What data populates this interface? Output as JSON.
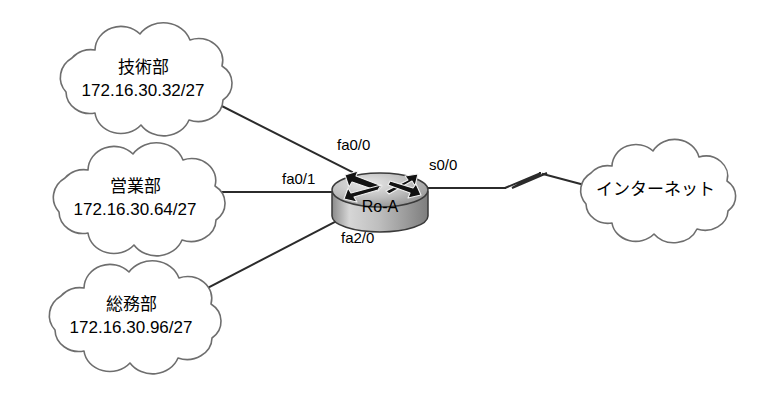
{
  "diagram": {
    "background_color": "#ffffff",
    "line_color": "#2b2b2b",
    "cloud_stroke_color": "#6e6e6e",
    "router_fill_color": "#a9a9a9"
  },
  "clouds": [
    {
      "id": "cloud-gijutsubu",
      "name": "技術部",
      "subnet": "172.16.30.32/27",
      "cx": 143,
      "cy": 78,
      "rx": 88,
      "ry": 53
    },
    {
      "id": "cloud-eigyoubu",
      "name": "営業部",
      "subnet": "172.16.30.64/27",
      "cx": 135,
      "cy": 197,
      "rx": 88,
      "ry": 53
    },
    {
      "id": "cloud-soumubu",
      "name": "総務部",
      "subnet": "172.16.30.96/27",
      "cx": 131,
      "cy": 315,
      "rx": 88,
      "ry": 53
    },
    {
      "id": "cloud-internet",
      "name": "インターネット",
      "subnet": "",
      "cx": 652,
      "cy": 188,
      "rx": 80,
      "ry": 48
    }
  ],
  "router": {
    "name": "Ro-A",
    "icon": "router-icon",
    "cx": 380,
    "cy": 192,
    "rx": 48,
    "top_y": 170,
    "bottom_y": 215
  },
  "interfaces": [
    {
      "label": "fa0/0",
      "x": 337,
      "y": 150,
      "connects": "技術部"
    },
    {
      "label": "fa0/1",
      "x": 282,
      "y": 184,
      "connects": "営業部"
    },
    {
      "label": "fa2/0",
      "x": 341,
      "y": 243,
      "connects": "総務部"
    },
    {
      "label": "s0/0",
      "x": 429,
      "y": 170,
      "connects": "インターネット"
    }
  ],
  "links": [
    {
      "id": "link-fa00",
      "from": "技術部",
      "to": "fa0/0",
      "type": "ethernet"
    },
    {
      "id": "link-fa01",
      "from": "営業部",
      "to": "fa0/1",
      "type": "ethernet"
    },
    {
      "id": "link-fa20",
      "from": "総務部",
      "to": "fa2/0",
      "type": "ethernet"
    },
    {
      "id": "link-s00",
      "from": "s0/0",
      "to": "インターネット",
      "type": "serial"
    }
  ]
}
